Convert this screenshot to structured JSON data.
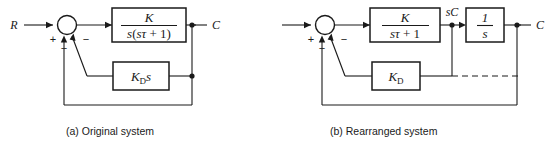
{
  "figure": {
    "type": "control-block-diagram",
    "background": "#ffffff",
    "line_color": "#1a1a1a"
  },
  "diagram_a": {
    "caption": "(a) Original system",
    "input_label": "R",
    "output_label": "C",
    "summing_junction": {
      "name": "summing-junction-a",
      "signs": [
        "+",
        "−",
        "−"
      ],
      "plus": "+",
      "minus_left": "−",
      "minus_right": "−"
    },
    "forward_block": {
      "name": "forward-block-a",
      "numerator": "K",
      "denominator_prefix": "s",
      "denominator": "s(sτ + 1)",
      "denom_open": "(",
      "denom_s": "s",
      "denom_tau": "τ",
      "denom_tail": "+ 1)"
    },
    "feedback_block": {
      "name": "feedback-block-a",
      "label": "K",
      "subscript": "D",
      "suffix": "s",
      "full": "Kₒs"
    }
  },
  "diagram_b": {
    "caption": "(b) Rearranged system",
    "output_label": "C",
    "mid_signal_label": "sC",
    "summing_junction": {
      "name": "summing-junction-b",
      "signs": [
        "+",
        "−",
        "−"
      ],
      "plus": "+",
      "minus_left": "−",
      "minus_right": "−"
    },
    "forward_block": {
      "name": "forward-block-b",
      "numerator": "K",
      "denominator": "sτ + 1",
      "denom_s": "s",
      "denom_tau": "τ",
      "denom_tail": "+ 1"
    },
    "integrator_block": {
      "name": "integrator-block-b",
      "numerator": "1",
      "denominator": "s"
    },
    "feedback_block": {
      "name": "feedback-block-b",
      "label": "K",
      "subscript": "D",
      "full": "Kₒ"
    }
  }
}
